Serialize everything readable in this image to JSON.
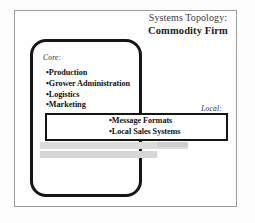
{
  "diagram": {
    "title": {
      "line1": "Systems Topology:",
      "line2": "Commodity Firm"
    },
    "core_group": {
      "label": "Core:",
      "items": [
        "Production",
        "Grower Administration",
        "Logistics",
        "Marketing"
      ]
    },
    "local_group": {
      "label": "Local:",
      "items": [
        "Message Formats",
        "Local Sales Systems"
      ]
    },
    "bullet_glyph": "•",
    "colors": {
      "ink": "#151515",
      "frame": "#9a9a9a",
      "paper": "#fdfdfd",
      "artifact_gray": "#dcdcdc"
    }
  }
}
